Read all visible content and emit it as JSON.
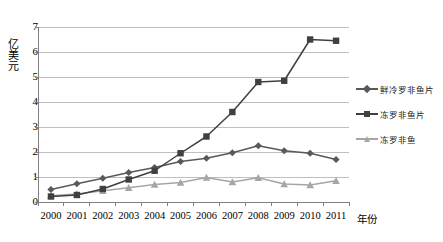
{
  "chart_data": {
    "type": "line",
    "title": "",
    "xlabel": "年份",
    "ylabel": "亿美元",
    "categories": [
      "2000",
      "2001",
      "2002",
      "2003",
      "2004",
      "2005",
      "2006",
      "2007",
      "2008",
      "2009",
      "2010",
      "2011"
    ],
    "x": [
      2000,
      2001,
      2002,
      2003,
      2004,
      2005,
      2006,
      2007,
      2008,
      2009,
      2010,
      2011
    ],
    "ylim": [
      0,
      7
    ],
    "yticks": [
      "0",
      "1",
      "2",
      "3",
      "4",
      "5",
      "6",
      "7"
    ],
    "grid": "horizontal",
    "legend_position": "right",
    "series": [
      {
        "name": "鲜冷罗非鱼片",
        "marker": "diamond",
        "color": "#595959",
        "values": [
          0.5,
          0.73,
          0.95,
          1.18,
          1.38,
          1.62,
          1.75,
          1.97,
          2.25,
          2.05,
          1.95,
          1.7
        ]
      },
      {
        "name": "冻罗非鱼片",
        "marker": "square",
        "color": "#404040",
        "values": [
          0.22,
          0.28,
          0.52,
          0.9,
          1.25,
          1.95,
          2.62,
          3.6,
          4.8,
          4.85,
          6.5,
          6.45
        ]
      },
      {
        "name": "冻罗非鱼",
        "marker": "triangle",
        "color": "#a6a6a6",
        "values": [
          0.25,
          0.32,
          0.45,
          0.57,
          0.7,
          0.78,
          0.98,
          0.8,
          0.97,
          0.72,
          0.68,
          0.85
        ]
      }
    ]
  },
  "axis": {
    "y_label": "亿美元",
    "x_label": "年份"
  },
  "colors": {
    "gridline": "#bfbfbf",
    "axis": "#808080",
    "series_fresh": "#595959",
    "series_frozen_fillet": "#404040",
    "series_frozen_whole": "#a6a6a6",
    "background": "#ffffff"
  }
}
